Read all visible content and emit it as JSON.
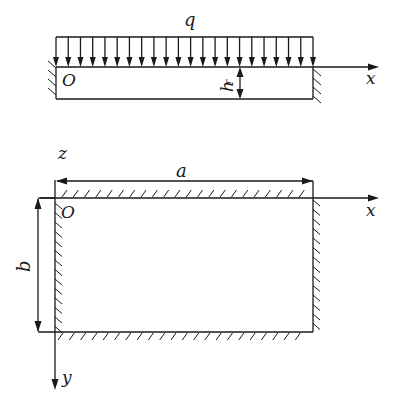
{
  "figure": {
    "top_view": {
      "load_label": "q",
      "origin_label": "O",
      "x_axis_label": "x",
      "thickness_label": "h",
      "thickness_subscript": "r",
      "load_arrow_count": 22
    },
    "plan_view": {
      "z_label": "z",
      "width_label": "a",
      "height_label": "b",
      "origin_label": "O",
      "x_axis_label": "x",
      "y_axis_label": "y"
    }
  },
  "colors": {
    "line": "#1a1a1a",
    "background": "#ffffff"
  }
}
